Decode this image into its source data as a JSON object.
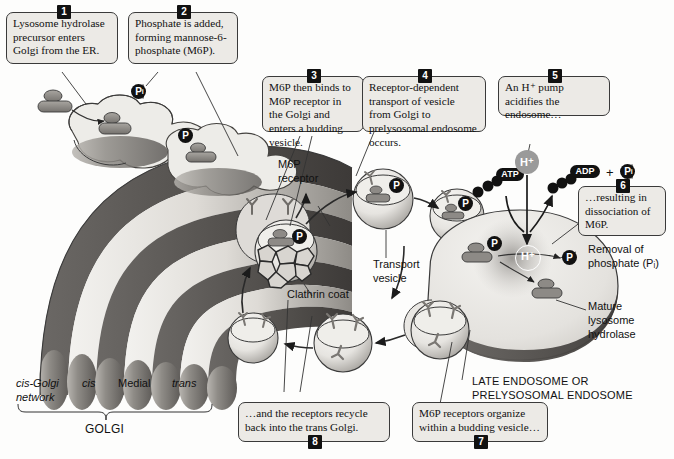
{
  "figure": {
    "background": "#fdfdfc",
    "ink": "#111111"
  },
  "callouts": [
    {
      "id": 1,
      "number": "1",
      "badge_pos": "top",
      "text": "Lysosome hydrolase precursor enters Golgi from the ER."
    },
    {
      "id": 2,
      "number": "2",
      "badge_pos": "top",
      "text": "Phosphate is added, forming mannose-6-phosphate (M6P)."
    },
    {
      "id": 3,
      "number": "3",
      "badge_pos": "top",
      "text": "M6P then binds to M6P receptor in the Golgi and enters a budding vesicle."
    },
    {
      "id": 4,
      "number": "4",
      "badge_pos": "top",
      "text": "Receptor-dependent transport of vesicle from Golgi to prelysosomal endosome occurs."
    },
    {
      "id": 5,
      "number": "5",
      "badge_pos": "top",
      "text": "An H⁺ pump acidifies the endosome…"
    },
    {
      "id": 6,
      "number": "6",
      "badge_pos": "top",
      "text": "…resulting in dissociation of M6P."
    },
    {
      "id": 7,
      "number": "7",
      "badge_pos": "bottom",
      "text": "M6P receptors organize within a budding vesicle…"
    },
    {
      "id": 8,
      "number": "8",
      "badge_pos": "bottom",
      "text": "…and the receptors recycle back into the trans Golgi."
    }
  ],
  "labels": {
    "m6p_receptor": "M6P\nreceptor",
    "clathrin_coat": "Clathrin coat",
    "transport_vesicle": "Transport\nvesicle",
    "removal_phosphate_line1": "Removal of",
    "removal_phosphate_line2": "phosphate (Pᵢ)",
    "mature_hydrolase": "Mature\nlysosome\nhydrolase",
    "late_endosome": "LATE ENDOSOME OR\nPRELYSOSOMAL ENDOSOME",
    "golgi_bracket": "GOLGI",
    "cis_golgi_network": "cis-Golgi\nnetwork",
    "cis": "cis",
    "medial": "Medial",
    "trans": "trans"
  },
  "tokens": {
    "phosphate_pi_golgi": "Pi",
    "phosphate_p": "P",
    "atp": "ATP",
    "adp": "ADP",
    "pi": "Pi",
    "plus": "+",
    "proton_outside": "H⁺",
    "proton_inside": "H⁺"
  },
  "colors": {
    "callout_fill": "#eceae6",
    "callout_border": "#3a3a3a",
    "badge_fill": "#111111",
    "golgi_light": "#e7e5e1",
    "golgi_mid": "#9d9a95",
    "golgi_dark": "#595654",
    "vesicle_light": "#efeeea",
    "endosome_fill": "#e9e7e3",
    "cargo_gray": "#8d8a86"
  }
}
